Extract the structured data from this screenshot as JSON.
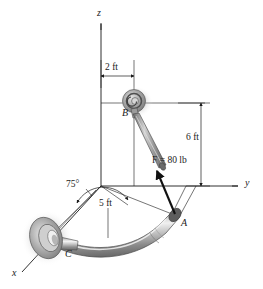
{
  "figure": {
    "type": "engineering-statics-diagram",
    "background_color": "#ffffff",
    "line_color": "#1a1a1a",
    "pipe_color": "#b9b9b9",
    "pipe_shadow_color": "#c9c9c9",
    "flange_color": "#a8a8a8"
  },
  "axes": [
    {
      "name": "z-axis",
      "label": "z",
      "direction": "up"
    },
    {
      "name": "y-axis",
      "label": "y",
      "direction": "right"
    },
    {
      "name": "x-axis",
      "label": "x",
      "direction": "lower-left"
    }
  ],
  "points": [
    {
      "name": "point-a",
      "label": "A",
      "description": "free end of curved pipe where cable attaches"
    },
    {
      "name": "point-b",
      "label": "B",
      "description": "eyebolt anchor on vertical wall"
    },
    {
      "name": "point-c",
      "label": "C",
      "description": "flanged fixed support of pipe"
    }
  ],
  "dimensions": [
    {
      "name": "dim-2ft",
      "label": "2 ft",
      "value": 2,
      "unit": "ft",
      "orientation": "horizontal",
      "description": "offset of B from z axis"
    },
    {
      "name": "dim-6ft",
      "label": "6 ft",
      "value": 6,
      "unit": "ft",
      "orientation": "vertical",
      "description": "height of B above the xy plane"
    },
    {
      "name": "dim-5ft",
      "label": "5 ft",
      "value": 5,
      "unit": "ft",
      "orientation": "inclined",
      "description": "horizontal span of pipe chord from origin"
    }
  ],
  "angles": [
    {
      "name": "angle-75",
      "label": "75°",
      "value": 75,
      "unit": "deg",
      "description": "angle between pipe chord and x axis"
    }
  ],
  "force": {
    "name": "force-f",
    "label": "F = 80 lb",
    "symbol": "F",
    "magnitude": 80,
    "unit": "lb",
    "applied_at": "A",
    "directed_toward": "B"
  }
}
